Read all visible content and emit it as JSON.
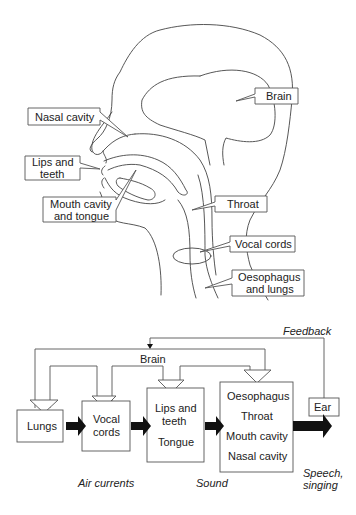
{
  "anatomy": {
    "labels": {
      "brain": "Brain",
      "nasal_cavity": "Nasal cavity",
      "lips_teeth_1": "Lips and",
      "lips_teeth_2": "teeth",
      "mouth_tongue_1": "Mouth cavity",
      "mouth_tongue_2": "and tongue",
      "throat": "Throat",
      "vocal_cords": "Vocal cords",
      "oesophagus_lungs_1": "Oesophagus",
      "oesophagus_lungs_2": "and lungs"
    }
  },
  "flow": {
    "feedback": "Feedback",
    "brain": "Brain",
    "boxes": {
      "lungs": "Lungs",
      "vocal_1": "Vocal",
      "vocal_2": "cords",
      "lips_1": "Lips and",
      "lips_2": "teeth",
      "tongue": "Tongue",
      "tract_1": "Oesophagus",
      "tract_2": "Throat",
      "tract_3": "Mouth cavity",
      "tract_4": "Nasal cavity",
      "ear": "Ear"
    },
    "captions": {
      "air": "Air currents",
      "sound": "Sound",
      "speech_1": "Speech,",
      "speech_2": "singing"
    }
  }
}
